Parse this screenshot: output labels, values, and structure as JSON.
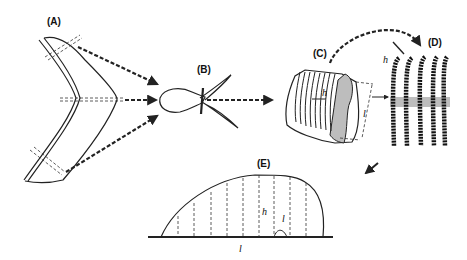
{
  "figure": {
    "panels": [
      {
        "id": "A",
        "label": "(A)",
        "description": "boomerang-shaped leaf/tissue outline with three dashed cut lines"
      },
      {
        "id": "B",
        "label": "(B)",
        "description": "bulb-shaped structure with two curved horns"
      },
      {
        "id": "C",
        "label": "(C)",
        "description": "sectioned block with parallel lamellae",
        "symbols": [
          "h",
          "l"
        ]
      },
      {
        "id": "D",
        "label": "(D)",
        "description": "beaded vertical strands crossing a grey band",
        "symbols": [
          "h"
        ]
      },
      {
        "id": "E",
        "label": "(E)",
        "description": "dome profile with vertical dashed lines over baseline",
        "symbols": [
          "h",
          "l",
          "l"
        ]
      }
    ],
    "symbols": {
      "h": "h",
      "l": "l"
    },
    "colors": {
      "ink": "#222222",
      "shade": "#bdbdbd",
      "background": "#ffffff"
    }
  }
}
